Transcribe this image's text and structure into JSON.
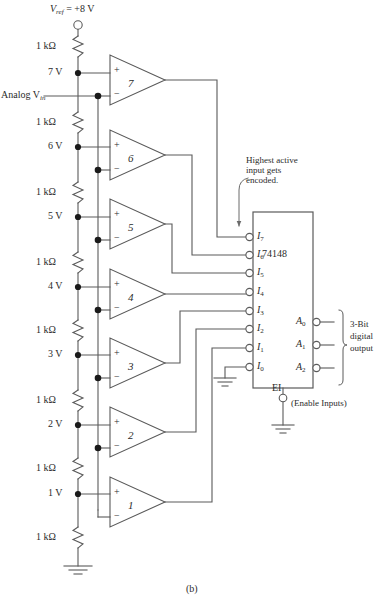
{
  "figure": {
    "caption": "(b)",
    "vref_label_pre": "V",
    "vref_label_sub": "ref",
    "vref_label_post": " = +8 V",
    "analog_in_pre": "Analog V",
    "analog_in_sub": "in",
    "annotation": "Highest active\ninput gets\nencoded.",
    "annotation_line1": "Highest active",
    "annotation_line2": "input gets",
    "annotation_line3": "encoded.",
    "chip_name": "74148",
    "enable_pin": "EI",
    "enable_note": "(Enable Inputs)",
    "output_bracket_line1": "3-Bit",
    "output_bracket_line2": "digital",
    "output_bracket_line3": "output",
    "line_color": "#5a5a5a",
    "text_color": "#2b2b2b"
  },
  "resistors": [
    {
      "label": "1 kΩ",
      "y": 46
    },
    {
      "label": "1 kΩ",
      "y": 122
    },
    {
      "label": "1 kΩ",
      "y": 192
    },
    {
      "label": "1 kΩ",
      "y": 262
    },
    {
      "label": "1 kΩ",
      "y": 330
    },
    {
      "label": "1 kΩ",
      "y": 400
    },
    {
      "label": "1 kΩ",
      "y": 468
    },
    {
      "label": "1 kΩ",
      "y": 537
    }
  ],
  "tap_voltages": [
    {
      "label": "7 V",
      "y": 73
    },
    {
      "label": "6 V",
      "y": 147
    },
    {
      "label": "5 V",
      "y": 217
    },
    {
      "label": "4 V",
      "y": 287
    },
    {
      "label": "3 V",
      "y": 355
    },
    {
      "label": "2 V",
      "y": 425
    },
    {
      "label": "1 V",
      "y": 494
    }
  ],
  "comparators": [
    {
      "num": "7",
      "y": 80
    },
    {
      "num": "6",
      "y": 155
    },
    {
      "num": "5",
      "y": 224
    },
    {
      "num": "4",
      "y": 294
    },
    {
      "num": "3",
      "y": 363
    },
    {
      "num": "2",
      "y": 432
    },
    {
      "num": "1",
      "y": 502
    }
  ],
  "comparator_pins": {
    "plus": "+",
    "minus": "−"
  },
  "encoder_inputs": [
    {
      "name": "I",
      "sub": "7",
      "y": 237
    },
    {
      "name": "I",
      "sub": "6",
      "y": 255
    },
    {
      "name": "I",
      "sub": "5",
      "y": 273
    },
    {
      "name": "I",
      "sub": "4",
      "y": 292
    },
    {
      "name": "I",
      "sub": "3",
      "y": 311
    },
    {
      "name": "I",
      "sub": "2",
      "y": 329
    },
    {
      "name": "I",
      "sub": "1",
      "y": 348
    },
    {
      "name": "I",
      "sub": "0",
      "y": 367
    }
  ],
  "encoder_outputs": [
    {
      "name": "A",
      "sub": "0",
      "y": 322
    },
    {
      "name": "A",
      "sub": "1",
      "y": 345
    },
    {
      "name": "A",
      "sub": "2",
      "y": 368
    }
  ]
}
